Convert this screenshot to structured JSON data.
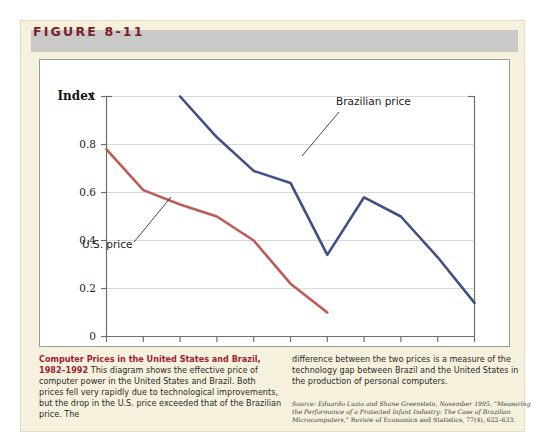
{
  "figure": {
    "label": "FIGURE 8-11",
    "label_color": "#7b1e2b",
    "panel_bg": "#f6f1dc",
    "header_bg": "#c9c9c7"
  },
  "caption": {
    "title": "Computer Prices in the United States and Brazil, 1982–1992",
    "title_color": "#9b2335",
    "body_left": " This diagram shows the effective price of computer power in the United States and Brazil. Both prices fell very rapidly due to technological improvements, but the drop in the U.S. price exceeded that of the Brazilian price. The",
    "body_right": "difference between the two prices is a measure of the technology gap between Brazil and the United States in the production of personal computers.",
    "source_prefix": "Source:",
    "source_italic": "Eduardo Luzio and Shane Greenstein, November 1995, “Measuring the Performance of a Protected Infant Industry: The Case of Brazilian Microcomputers,”",
    "source_rest": " Review of Economics and Statistics, 77(4), 622–633."
  },
  "chart_data": {
    "type": "line",
    "title": "",
    "xlabel": "",
    "ylabel": "Index",
    "xlim": [
      1982,
      1992
    ],
    "ylim": [
      0,
      1
    ],
    "grid": true,
    "legend": "inline-annotations",
    "x": [
      1982,
      1983,
      1984,
      1985,
      1986,
      1987,
      1988,
      1989,
      1990,
      1991,
      1992
    ],
    "xtick_labels": [
      "1982",
      "1983",
      "1984",
      "1985",
      "1986",
      "1987",
      "1988",
      "1989",
      "1990",
      "1991",
      "1992"
    ],
    "ytick_labels": [
      "0",
      "0.2",
      "0.4",
      "0.6",
      "0.8",
      "1"
    ],
    "ytick_values": [
      0,
      0.2,
      0.4,
      0.6,
      0.8,
      1
    ],
    "series": [
      {
        "name": "U.S. price",
        "color": "#bf5b55",
        "x": [
          1982,
          1983,
          1984,
          1985,
          1986,
          1987,
          1988
        ],
        "values": [
          0.78,
          0.61,
          0.55,
          0.5,
          0.4,
          0.22,
          0.1
        ]
      },
      {
        "name": "Brazilian price",
        "color": "#414f87",
        "x": [
          1984,
          1985,
          1986,
          1987,
          1988,
          1989,
          1990,
          1991,
          1992
        ],
        "values": [
          1.0,
          0.83,
          0.69,
          0.64,
          0.34,
          0.58,
          0.5,
          0.33,
          0.14
        ]
      }
    ],
    "annotations": [
      {
        "text": "Brazilian price",
        "x_px": 296,
        "y_px": 45
      },
      {
        "text": "U.S. price",
        "x_px": 42,
        "y_px": 185
      }
    ]
  }
}
